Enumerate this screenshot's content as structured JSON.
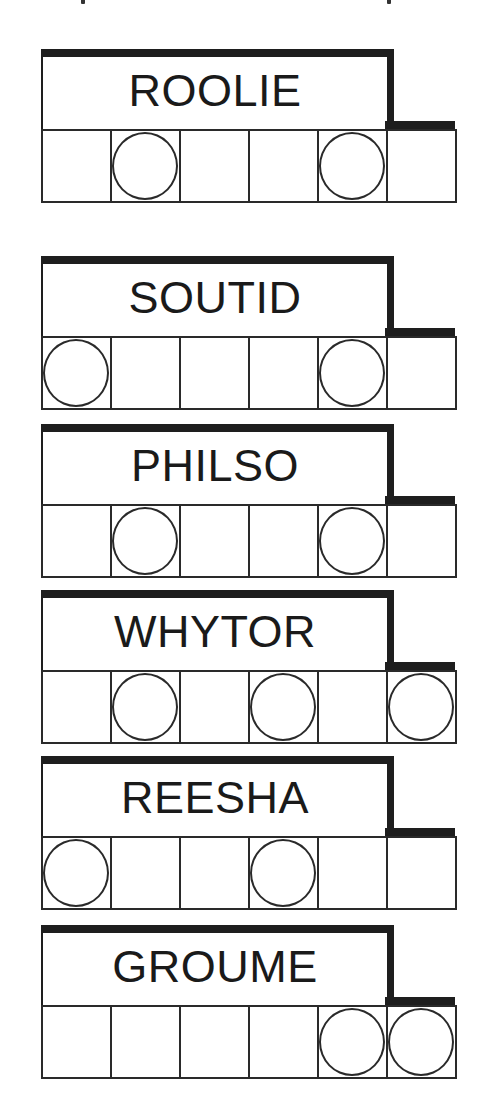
{
  "puzzles": [
    {
      "scrambled": "ROOLIE",
      "top": 49,
      "circled": [
        1,
        4
      ]
    },
    {
      "scrambled": "SOUTID",
      "top": 256,
      "circled": [
        0,
        4
      ]
    },
    {
      "scrambled": "PHILSO",
      "top": 424,
      "circled": [
        1,
        4
      ]
    },
    {
      "scrambled": "WHYTOR",
      "top": 590,
      "circled": [
        1,
        3,
        5
      ]
    },
    {
      "scrambled": "REESHA",
      "top": 756,
      "circled": [
        0,
        3
      ]
    },
    {
      "scrambled": "GROUME",
      "top": 925,
      "circled": [
        4,
        5
      ]
    }
  ],
  "cells_per_word": 6,
  "colors": {
    "ink": "#1e1e1e",
    "background": "#ffffff"
  }
}
